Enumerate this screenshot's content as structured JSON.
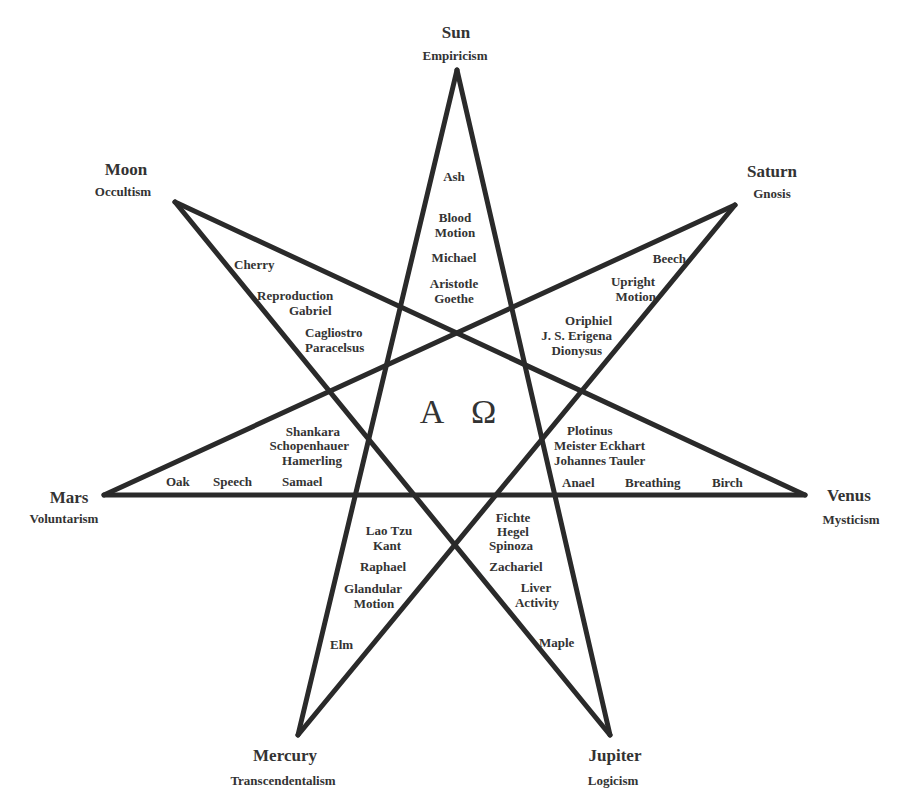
{
  "center": {
    "symbol": "A Ω"
  },
  "vertices": [
    {
      "id": "sun",
      "planet": "Sun",
      "school": "Empiricism",
      "x": 457,
      "y": 70
    },
    {
      "id": "saturn",
      "planet": "Saturn",
      "school": "Gnosis",
      "x": 735,
      "y": 205
    },
    {
      "id": "venus",
      "planet": "Venus",
      "school": "Mysticism",
      "x": 805,
      "y": 495
    },
    {
      "id": "jupiter",
      "planet": "Jupiter",
      "school": "Logicism",
      "x": 610,
      "y": 735
    },
    {
      "id": "mercury",
      "planet": "Mercury",
      "school": "Transcendentalism",
      "x": 298,
      "y": 735
    },
    {
      "id": "mars",
      "planet": "Mars",
      "school": "Voluntarism",
      "x": 104,
      "y": 495
    },
    {
      "id": "moon",
      "planet": "Moon",
      "school": "Occultism",
      "x": 175,
      "y": 202
    }
  ],
  "edges": [
    [
      "sun",
      "jupiter"
    ],
    [
      "jupiter",
      "moon"
    ],
    [
      "moon",
      "venus"
    ],
    [
      "venus",
      "mars"
    ],
    [
      "mars",
      "saturn"
    ],
    [
      "saturn",
      "mercury"
    ],
    [
      "mercury",
      "sun"
    ]
  ],
  "points": {
    "sun": {
      "tree": "Ash",
      "process": "Blood Motion",
      "archangel": "Michael",
      "thinkers": "Aristotle Goethe"
    },
    "saturn": {
      "tree": "Beech",
      "process": "Upright Motion",
      "archangel": "Oriphiel",
      "thinkers": "J. S. Erigena Dionysus"
    },
    "venus": {
      "tree": "Birch",
      "process": "Breathing",
      "archangel": "Anael",
      "thinkers": "Plotinus Meister Eckhart Johannes Tauler"
    },
    "jupiter": {
      "tree": "Maple",
      "process": "Liver Activity",
      "archangel": "Zachariel",
      "thinkers": "Fichte Hegel Spinoza"
    },
    "mercury": {
      "tree": "Elm",
      "process": "Glandular Motion",
      "archangel": "Raphael",
      "thinkers": "Lao Tzu Kant"
    },
    "mars": {
      "tree": "Oak",
      "process": "Speech",
      "archangel": "Samael",
      "thinkers": "Shankara Schopenhauer Hamerling"
    },
    "moon": {
      "tree": "Cherry",
      "process": "Reproduction",
      "archangel": "Gabriel",
      "thinkers": "Cagliostro Paracelsus"
    }
  },
  "labels": {
    "sun_planet": "Sun",
    "sun_school": "Empiricism",
    "saturn_planet": "Saturn",
    "saturn_school": "Gnosis",
    "venus_planet": "Venus",
    "venus_school": "Mysticism",
    "jupiter_planet": "Jupiter",
    "jupiter_school": "Logicism",
    "mercury_planet": "Mercury",
    "mercury_school": "Transcendentalism",
    "mars_planet": "Mars",
    "mars_school": "Voluntarism",
    "moon_planet": "Moon",
    "moon_school": "Occultism",
    "sun_1": "Ash",
    "sun_2": "Blood",
    "sun_3": "Motion",
    "sun_4": "Michael",
    "sun_5": "Aristotle",
    "sun_6": "Goethe",
    "saturn_1": "Beech",
    "saturn_2": "Upright",
    "saturn_3": "Motion",
    "saturn_4": "Oriphiel",
    "saturn_5": "J. S. Erigena",
    "saturn_6": "Dionysus",
    "venus_1": "Plotinus",
    "venus_2": "Meister Eckhart",
    "venus_3": "Johannes Tauler",
    "venus_4": "Anael",
    "venus_5": "Breathing",
    "venus_6": "Birch",
    "jupiter_1": "Fichte",
    "jupiter_2": "Hegel",
    "jupiter_3": "Spinoza",
    "jupiter_4": "Zachariel",
    "jupiter_5": "Liver",
    "jupiter_6": "Activity",
    "jupiter_7": "Maple",
    "mercury_1": "Lao Tzu",
    "mercury_2": "Kant",
    "mercury_3": "Raphael",
    "mercury_4": "Glandular",
    "mercury_5": "Motion",
    "mercury_6": "Elm",
    "mars_1": "Shankara",
    "mars_2": "Schopenhauer",
    "mars_3": "Hamerling",
    "mars_4": "Oak",
    "mars_5": "Speech",
    "mars_6": "Samael",
    "moon_1": "Cherry",
    "moon_2": "Reproduction",
    "moon_3": "Gabriel",
    "moon_4": "Cagliostro",
    "moon_5": "Paracelsus"
  },
  "style": {
    "line_color": "#2a2a2a",
    "text_color": "#333333",
    "background": "#ffffff"
  }
}
